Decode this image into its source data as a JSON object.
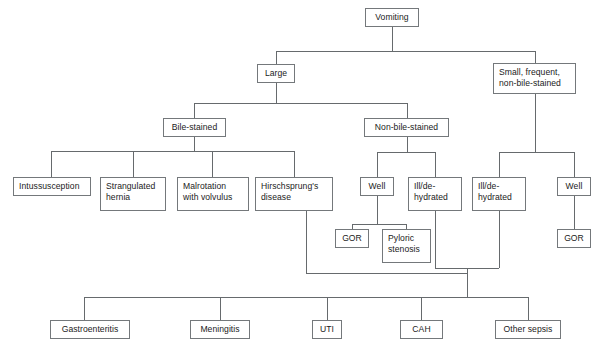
{
  "diagram": {
    "type": "flowchart",
    "line_color": "#666a6d",
    "box_border_color": "#74787b",
    "text_color": "#1b1b1b",
    "background_color": "#ffffff",
    "nodes": [
      {
        "id": "vomiting",
        "label": "Vomiting",
        "x": 365,
        "y": 8,
        "w": 54,
        "h": 19,
        "align": "center"
      },
      {
        "id": "large",
        "label": "Large",
        "x": 257,
        "y": 64,
        "w": 38,
        "h": 19,
        "align": "center"
      },
      {
        "id": "small_frequent",
        "label": "Small, frequent,\nnon-bile-stained",
        "x": 493,
        "y": 63,
        "w": 83,
        "h": 31,
        "align": "left"
      },
      {
        "id": "bile_stained",
        "label": "Bile-stained",
        "x": 163,
        "y": 118,
        "w": 63,
        "h": 19,
        "align": "center"
      },
      {
        "id": "non_bile_stained",
        "label": "Non-bile-stained",
        "x": 364,
        "y": 118,
        "w": 85,
        "h": 19,
        "align": "center"
      },
      {
        "id": "intussusception",
        "label": "Intussusception",
        "x": 13,
        "y": 177,
        "w": 78,
        "h": 19,
        "align": "left"
      },
      {
        "id": "strangulated",
        "label": "Strangulated\nhernia",
        "x": 100,
        "y": 177,
        "w": 66,
        "h": 34,
        "align": "left"
      },
      {
        "id": "malrotation",
        "label": "Malrotation\nwith volvulus",
        "x": 177,
        "y": 177,
        "w": 72,
        "h": 34,
        "align": "left"
      },
      {
        "id": "hirschsprungs",
        "label": "Hirschsprung's\ndisease",
        "x": 255,
        "y": 177,
        "w": 78,
        "h": 34,
        "align": "left"
      },
      {
        "id": "well_left",
        "label": "Well",
        "x": 360,
        "y": 177,
        "w": 34,
        "h": 19,
        "align": "center"
      },
      {
        "id": "ill_dehydrated_1",
        "label": "Ill/de-\nhydrated",
        "x": 408,
        "y": 177,
        "w": 54,
        "h": 34,
        "align": "left"
      },
      {
        "id": "ill_dehydrated_2",
        "label": "Ill/de-\nhydrated",
        "x": 472,
        "y": 177,
        "w": 54,
        "h": 34,
        "align": "left"
      },
      {
        "id": "well_right",
        "label": "Well",
        "x": 557,
        "y": 177,
        "w": 34,
        "h": 19,
        "align": "center"
      },
      {
        "id": "gor_left",
        "label": "GOR",
        "x": 335,
        "y": 229,
        "w": 34,
        "h": 19,
        "align": "center"
      },
      {
        "id": "pyloric_stenosis",
        "label": "Pyloric\nstenosis",
        "x": 382,
        "y": 229,
        "w": 49,
        "h": 34,
        "align": "left"
      },
      {
        "id": "gor_right",
        "label": "GOR",
        "x": 557,
        "y": 229,
        "w": 34,
        "h": 19,
        "align": "center"
      },
      {
        "id": "gastroenteritis",
        "label": "Gastroenteritis",
        "x": 50,
        "y": 320,
        "w": 80,
        "h": 19,
        "align": "center"
      },
      {
        "id": "meningitis",
        "label": "Meningitis",
        "x": 190,
        "y": 320,
        "w": 60,
        "h": 19,
        "align": "center"
      },
      {
        "id": "uti",
        "label": "UTI",
        "x": 312,
        "y": 320,
        "w": 30,
        "h": 19,
        "align": "center"
      },
      {
        "id": "cah",
        "label": "CAH",
        "x": 400,
        "y": 320,
        "w": 43,
        "h": 19,
        "align": "center"
      },
      {
        "id": "other_sepsis",
        "label": "Other sepsis",
        "x": 495,
        "y": 320,
        "w": 66,
        "h": 19,
        "align": "center"
      }
    ],
    "connector_paths": [
      "M 392 27 L 392 51",
      "M 276 51 L 535 51",
      "M 276 51 L 276 64",
      "M 535 51 L 535 63",
      "M 276 83 L 276 103",
      "M 194 103 L 407 103",
      "M 194 103 L 194 118",
      "M 407 103 L 407 118",
      "M 194 137 L 194 151",
      "M 51 151 L 294 151",
      "M 51 151 L 51 177",
      "M 133 151 L 133 177",
      "M 212 151 L 212 177",
      "M 294 151 L 294 177",
      "M 407 137 L 407 152",
      "M 377 152 L 435 152",
      "M 377 152 L 377 177",
      "M 435 152 L 435 177",
      "M 377 196 L 377 224",
      "M 352 224 L 406 224",
      "M 352 224 L 352 229",
      "M 406 224 L 406 229",
      "M 535 94 L 535 152",
      "M 499 152 L 574 152",
      "M 499 152 L 499 177",
      "M 574 152 L 574 177",
      "M 574 196 L 574 229",
      "M 435 211 L 435 268",
      "M 499 211 L 499 268",
      "M 435 268 L 499 268",
      "M 306 211 L 306 273",
      "M 306 273 L 467 273",
      "M 467 268 L 467 297",
      "M 84 297 L 528 297",
      "M 84 297 L 84 320",
      "M 220 297 L 220 320",
      "M 327 297 L 327 320",
      "M 421 297 L 421 320",
      "M 528 297 L 528 320"
    ]
  }
}
